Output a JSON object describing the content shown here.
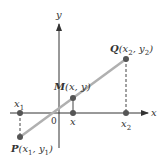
{
  "diagram": {
    "axes": {
      "x_label": "x",
      "y_label": "y",
      "origin_label": "0"
    },
    "points": {
      "P": {
        "name": "P",
        "coords": "(x",
        "sub1": "1",
        "mid": ", y",
        "sub2": "1",
        "end": ")"
      },
      "Q": {
        "name": "Q",
        "coords": "(x",
        "sub1": "2",
        "mid": ", y",
        "sub2": "2",
        "end": ")"
      },
      "M": {
        "name": "M",
        "coords": "(x, y)"
      }
    },
    "x_ticks": {
      "x1": {
        "base": "x",
        "sub": "1"
      },
      "x": {
        "base": "x"
      },
      "x2": {
        "base": "x",
        "sub": "2"
      }
    },
    "colors": {
      "segment": "#b0b0b0",
      "point": "#555555",
      "axis": "#333333"
    }
  }
}
